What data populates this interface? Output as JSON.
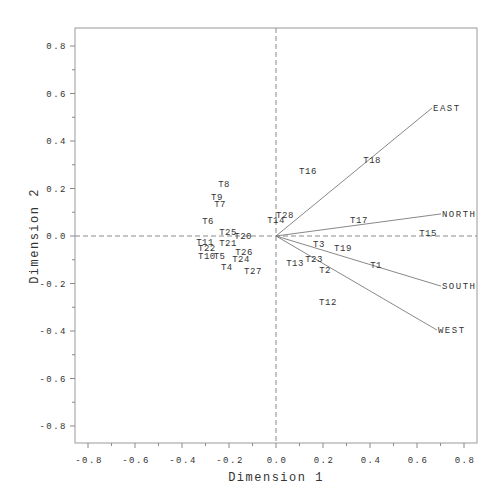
{
  "chart_data": {
    "type": "scatter",
    "subtype": "biplot",
    "title": "",
    "xlabel": "Dimension 1",
    "ylabel": "Dimension 2",
    "xlim": [
      -0.86,
      0.86
    ],
    "ylim": [
      -0.88,
      0.88
    ],
    "xticks": [
      -0.8,
      -0.6,
      -0.4,
      -0.2,
      0.0,
      0.2,
      0.4,
      0.6,
      0.8
    ],
    "xtick_labels": [
      "-0.8",
      "-0.6",
      "-0.4",
      "-0.2",
      "0.0",
      "0.2",
      "0.4",
      "0.6",
      "0.8"
    ],
    "yticks": [
      0.8,
      0.6,
      0.4,
      0.2,
      0.0,
      -0.2,
      -0.4,
      -0.6,
      -0.8
    ],
    "ytick_labels": [
      "0.8",
      "0.6",
      "0.4",
      "0.2",
      "0.0",
      "-0.2",
      "-0.4",
      "-0.6",
      "-0.8"
    ],
    "minor_ticks_per_interval": 1,
    "reference_lines": {
      "x": 0.0,
      "y": 0.0,
      "style": "dashed"
    },
    "grid": false,
    "legend": "none",
    "points": [
      {
        "label": "T1",
        "x": 0.426,
        "y": -0.122
      },
      {
        "label": "T2",
        "x": 0.209,
        "y": -0.143
      },
      {
        "label": "T3",
        "x": 0.183,
        "y": -0.034
      },
      {
        "label": "T4",
        "x": -0.209,
        "y": -0.131
      },
      {
        "label": "T5",
        "x": -0.24,
        "y": -0.084
      },
      {
        "label": "T6",
        "x": -0.289,
        "y": 0.063
      },
      {
        "label": "T7",
        "x": -0.238,
        "y": 0.135
      },
      {
        "label": "T8",
        "x": -0.221,
        "y": 0.219
      },
      {
        "label": "T9",
        "x": -0.251,
        "y": 0.164
      },
      {
        "label": "T10",
        "x": -0.294,
        "y": -0.084
      },
      {
        "label": "T11",
        "x": -0.302,
        "y": -0.025
      },
      {
        "label": "T12",
        "x": 0.221,
        "y": -0.278
      },
      {
        "label": "T13",
        "x": 0.081,
        "y": -0.114
      },
      {
        "label": "T14",
        "x": 0.0,
        "y": 0.067
      },
      {
        "label": "T15",
        "x": 0.647,
        "y": 0.013
      },
      {
        "label": "T16",
        "x": 0.136,
        "y": 0.274
      },
      {
        "label": "T17",
        "x": 0.353,
        "y": 0.067
      },
      {
        "label": "T18",
        "x": 0.409,
        "y": 0.32
      },
      {
        "label": "T19",
        "x": 0.285,
        "y": -0.051
      },
      {
        "label": "T20",
        "x": -0.14,
        "y": 0.0
      },
      {
        "label": "T21",
        "x": -0.204,
        "y": -0.029
      },
      {
        "label": "T22",
        "x": -0.294,
        "y": -0.051
      },
      {
        "label": "T23",
        "x": 0.162,
        "y": -0.097
      },
      {
        "label": "T24",
        "x": -0.149,
        "y": -0.097
      },
      {
        "label": "T25",
        "x": -0.204,
        "y": 0.017
      },
      {
        "label": "T26",
        "x": -0.136,
        "y": -0.067
      },
      {
        "label": "T27",
        "x": -0.098,
        "y": -0.147
      },
      {
        "label": "T28",
        "x": 0.038,
        "y": 0.088
      }
    ],
    "vectors": [
      {
        "label": "EAST",
        "x": 0.664,
        "y": 0.539
      },
      {
        "label": "NORTH",
        "x": 0.702,
        "y": 0.093
      },
      {
        "label": "SOUTH",
        "x": 0.702,
        "y": -0.211
      },
      {
        "label": "WEST",
        "x": 0.685,
        "y": -0.396
      }
    ]
  }
}
